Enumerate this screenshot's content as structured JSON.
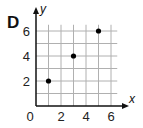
{
  "panel_label": "D",
  "chart_data": {
    "type": "scatter",
    "title": "",
    "xlabel": "x",
    "ylabel": "y",
    "x": [
      1,
      3,
      5
    ],
    "y": [
      2,
      4,
      6
    ],
    "points": [
      [
        1,
        2
      ],
      [
        3,
        4
      ],
      [
        5,
        6
      ]
    ],
    "xlim": [
      0,
      6.5
    ],
    "ylim": [
      0,
      6.5
    ],
    "xticks": [
      2,
      4,
      6
    ],
    "yticks": [
      2,
      4,
      6
    ],
    "origin_label": "0",
    "grid": true,
    "grid_step": 1,
    "legend": null,
    "colors": {
      "grid": "#b0b0b0",
      "axis": "#111111",
      "point": "#000000"
    }
  }
}
